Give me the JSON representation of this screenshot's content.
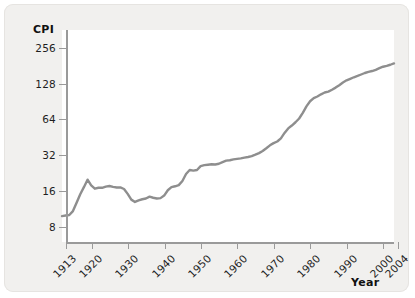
{
  "chart_data": {
    "type": "line",
    "title": "",
    "subtitle": "",
    "xlabel": "Year",
    "ylabel": "CPI",
    "yscale": "log2",
    "ylim": [
      6,
      360
    ],
    "xlim": [
      1913,
      2004
    ],
    "grid": false,
    "legend": null,
    "y_ticks": [
      8,
      16,
      32,
      64,
      128,
      256
    ],
    "y_tick_labels": [
      "8",
      "16",
      "32",
      "64",
      "128",
      "256"
    ],
    "x_ticks": [
      1913,
      1920,
      1930,
      1940,
      1950,
      1960,
      1970,
      1980,
      1990,
      2000,
      2004
    ],
    "x_tick_labels": [
      "1913",
      "1920",
      "1930",
      "1940",
      "1950",
      "1960",
      "1970",
      "1980",
      "1990",
      "2000",
      "2004"
    ],
    "series": [
      {
        "name": "CPI",
        "color": "#8e8e8e",
        "linewidth": 2.4,
        "marker": "none",
        "x": [
          1913,
          1914,
          1915,
          1916,
          1917,
          1918,
          1919,
          1920,
          1921,
          1922,
          1923,
          1924,
          1925,
          1926,
          1927,
          1928,
          1929,
          1930,
          1931,
          1932,
          1933,
          1934,
          1935,
          1936,
          1937,
          1938,
          1939,
          1940,
          1941,
          1942,
          1943,
          1944,
          1945,
          1946,
          1947,
          1948,
          1949,
          1950,
          1951,
          1952,
          1953,
          1954,
          1955,
          1956,
          1957,
          1958,
          1959,
          1960,
          1961,
          1962,
          1963,
          1964,
          1965,
          1966,
          1967,
          1968,
          1969,
          1970,
          1971,
          1972,
          1973,
          1974,
          1975,
          1976,
          1977,
          1978,
          1979,
          1980,
          1981,
          1982,
          1983,
          1984,
          1985,
          1986,
          1987,
          1988,
          1989,
          1990,
          1991,
          1992,
          1993,
          1994,
          1995,
          1996,
          1997,
          1998,
          1999,
          2000,
          2001,
          2002,
          2003,
          2004
        ],
        "y": [
          9.9,
          10.0,
          10.1,
          10.9,
          12.8,
          15.1,
          17.3,
          20.0,
          17.9,
          16.8,
          17.1,
          17.1,
          17.5,
          17.7,
          17.4,
          17.2,
          17.2,
          16.7,
          15.2,
          13.6,
          13.0,
          13.4,
          13.7,
          13.9,
          14.4,
          14.1,
          13.9,
          14.0,
          14.7,
          16.3,
          17.3,
          17.6,
          18.0,
          19.5,
          22.3,
          24.1,
          23.8,
          24.1,
          26.0,
          26.5,
          26.7,
          26.9,
          26.8,
          27.2,
          28.1,
          28.9,
          29.1,
          29.6,
          29.9,
          30.2,
          30.6,
          31.0,
          31.5,
          32.4,
          33.4,
          34.8,
          36.7,
          38.8,
          40.5,
          41.8,
          44.4,
          49.3,
          53.8,
          56.9,
          60.6,
          65.2,
          72.6,
          82.4,
          90.9,
          96.5,
          99.6,
          103.9,
          107.6,
          109.6,
          113.6,
          118.3,
          124.0,
          130.7,
          136.2,
          140.3,
          144.5,
          148.2,
          152.4,
          156.9,
          160.5,
          163.0,
          166.6,
          172.2,
          177.1,
          179.9,
          184.0,
          188.9
        ]
      }
    ]
  },
  "axes": {
    "y_title": "CPI",
    "x_title": "Year"
  }
}
